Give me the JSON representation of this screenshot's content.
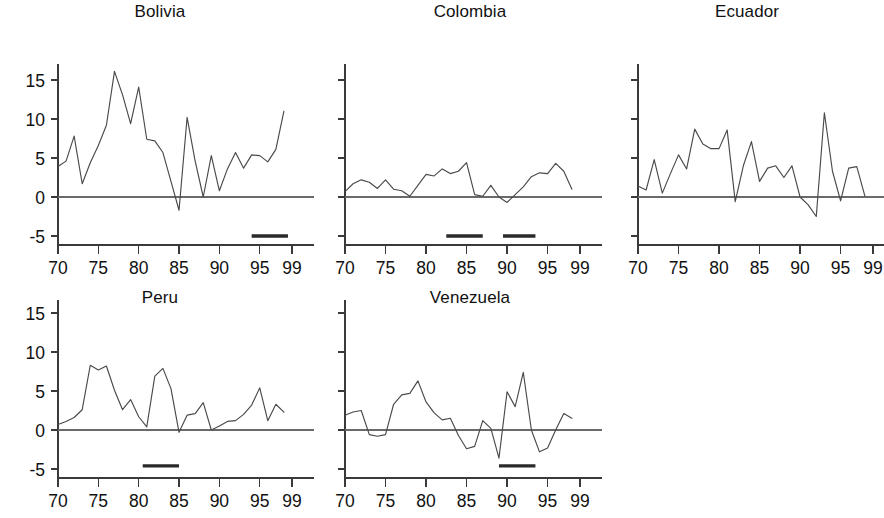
{
  "figure": {
    "background": "#ffffff",
    "line_color": "#4a4a4a",
    "axis_color": "#3a3a3a",
    "zero_line_color": "#6a6a6a",
    "bar_color": "#2a2a2a",
    "layout": "2 rows x 3 columns of small-multiple line panels"
  },
  "chart_data": [
    {
      "type": "line",
      "title": "Bolivia",
      "xlabel": "",
      "ylabel": "",
      "xlim": [
        70,
        99
      ],
      "ylim": [
        -6.5,
        17
      ],
      "yticks": [
        -5,
        0,
        5,
        10,
        15
      ],
      "ytick_labels": [
        "-5",
        "0",
        "5",
        "10",
        "15"
      ],
      "y_axis_labeled": true,
      "xticks": [
        70,
        75,
        80,
        85,
        90,
        95,
        99
      ],
      "xtick_labels": [
        "70",
        "75",
        "80",
        "85",
        "90",
        "95",
        "99"
      ],
      "grid": false,
      "legend": "none",
      "zero_reference_line": 0,
      "x": [
        70,
        71,
        72,
        73,
        74,
        75,
        76,
        77,
        78,
        79,
        80,
        81,
        82,
        83,
        84,
        85,
        86,
        87,
        88,
        89,
        90,
        91,
        92,
        93,
        94,
        95,
        96,
        97,
        98
      ],
      "values": [
        3.9,
        4.6,
        7.8,
        1.7,
        4.4,
        6.6,
        9.2,
        16.1,
        13.1,
        9.4,
        14.1,
        7.4,
        7.2,
        5.7,
        2.0,
        -1.7,
        10.2,
        4.6,
        0.0,
        5.3,
        0.8,
        3.6,
        5.7,
        3.7,
        5.4,
        5.3,
        4.5,
        6.1,
        11.0
      ],
      "annotations": [
        {
          "name": "crisis-bar",
          "label": "banking crisis period",
          "x_start": 94.0,
          "x_end": 98.5,
          "y": -5.0
        }
      ]
    },
    {
      "type": "line",
      "title": "Colombia",
      "xlabel": "",
      "ylabel": "",
      "xlim": [
        70,
        99
      ],
      "ylim": [
        -6.5,
        17
      ],
      "yticks": [
        -5,
        0,
        5,
        10,
        15
      ],
      "ytick_labels": [
        "",
        "",
        "",
        "",
        ""
      ],
      "y_axis_labeled": false,
      "xticks": [
        70,
        75,
        80,
        85,
        90,
        95,
        99
      ],
      "xtick_labels": [
        "70",
        "75",
        "80",
        "85",
        "90",
        "95",
        "99"
      ],
      "grid": false,
      "legend": "none",
      "zero_reference_line": 0,
      "x": [
        70,
        71,
        72,
        73,
        74,
        75,
        76,
        77,
        78,
        79,
        80,
        81,
        82,
        83,
        84,
        85,
        86,
        87,
        88,
        89,
        90,
        91,
        92,
        93,
        94,
        95,
        96,
        97,
        98
      ],
      "values": [
        0.7,
        1.7,
        2.2,
        1.9,
        1.1,
        2.2,
        1.0,
        0.8,
        0.1,
        1.5,
        2.9,
        2.7,
        3.6,
        3.0,
        3.3,
        4.4,
        0.3,
        0.1,
        1.5,
        0.0,
        -0.7,
        0.3,
        1.3,
        2.6,
        3.1,
        3.0,
        4.3,
        3.3,
        1.0
      ],
      "annotations": [
        {
          "name": "crisis-bar",
          "label": "banking crisis period",
          "x_start": 82.5,
          "x_end": 87.0,
          "y": -5.0
        },
        {
          "name": "crisis-bar",
          "label": "banking crisis period",
          "x_start": 89.5,
          "x_end": 93.5,
          "y": -5.0
        }
      ]
    },
    {
      "type": "line",
      "title": "Ecuador",
      "xlabel": "",
      "ylabel": "",
      "xlim": [
        70,
        99
      ],
      "ylim": [
        -6.5,
        17
      ],
      "yticks": [
        -5,
        0,
        5,
        10,
        15
      ],
      "ytick_labels": [
        "",
        "",
        "",
        "",
        ""
      ],
      "y_axis_labeled": false,
      "xticks": [
        70,
        75,
        80,
        85,
        90,
        95,
        99
      ],
      "xtick_labels": [
        "70",
        "75",
        "80",
        "85",
        "90",
        "95",
        "99"
      ],
      "grid": false,
      "legend": "none",
      "zero_reference_line": 0,
      "x": [
        70,
        71,
        72,
        73,
        74,
        75,
        76,
        77,
        78,
        79,
        80,
        81,
        82,
        83,
        84,
        85,
        86,
        87,
        88,
        89,
        90,
        91,
        92,
        93,
        94,
        95,
        96,
        97,
        98
      ],
      "values": [
        1.4,
        0.9,
        4.8,
        0.5,
        3.0,
        5.4,
        3.6,
        8.7,
        6.8,
        6.2,
        6.2,
        8.6,
        -0.6,
        4.0,
        7.1,
        2.0,
        3.7,
        4.0,
        2.5,
        4.0,
        0.0,
        -1.0,
        -2.5,
        10.8,
        3.3,
        -0.5,
        3.7,
        3.9,
        0.1
      ],
      "annotations": []
    },
    {
      "type": "line",
      "title": "Peru",
      "xlabel": "",
      "ylabel": "",
      "xlim": [
        70,
        99
      ],
      "ylim": [
        -6.5,
        17
      ],
      "yticks": [
        -5,
        0,
        5,
        10,
        15
      ],
      "ytick_labels": [
        "-5",
        "0",
        "5",
        "10",
        "15"
      ],
      "y_axis_labeled": true,
      "xticks": [
        70,
        75,
        80,
        85,
        90,
        95,
        99
      ],
      "xtick_labels": [
        "70",
        "75",
        "80",
        "85",
        "90",
        "95",
        "99"
      ],
      "grid": false,
      "legend": "none",
      "zero_reference_line": 0,
      "x": [
        70,
        71,
        72,
        73,
        74,
        75,
        76,
        77,
        78,
        79,
        80,
        81,
        82,
        83,
        84,
        85,
        86,
        87,
        88,
        89,
        90,
        91,
        92,
        93,
        94,
        95,
        96,
        97,
        98
      ],
      "values": [
        0.7,
        1.1,
        1.6,
        2.6,
        8.3,
        7.7,
        8.2,
        5.1,
        2.6,
        3.9,
        1.7,
        0.4,
        6.9,
        7.9,
        5.3,
        -0.3,
        1.9,
        2.1,
        3.5,
        0.0,
        0.5,
        1.1,
        1.2,
        2.0,
        3.2,
        5.4,
        1.2,
        3.3,
        2.3
      ],
      "annotations": [
        {
          "name": "crisis-bar",
          "label": "banking crisis period",
          "x_start": 80.5,
          "x_end": 85.0,
          "y": -4.6
        }
      ]
    },
    {
      "type": "line",
      "title": "Venezuela",
      "xlabel": "",
      "ylabel": "",
      "xlim": [
        70,
        99
      ],
      "ylim": [
        -6.5,
        17
      ],
      "yticks": [
        -5,
        0,
        5,
        10,
        15
      ],
      "ytick_labels": [
        "",
        "",
        "",
        "",
        ""
      ],
      "y_axis_labeled": false,
      "xticks": [
        70,
        75,
        80,
        85,
        90,
        95,
        99
      ],
      "xtick_labels": [
        "70",
        "75",
        "80",
        "85",
        "90",
        "95",
        "99"
      ],
      "grid": false,
      "legend": "none",
      "zero_reference_line": 0,
      "x": [
        70,
        71,
        72,
        73,
        74,
        75,
        76,
        77,
        78,
        79,
        80,
        81,
        82,
        83,
        84,
        85,
        86,
        87,
        88,
        89,
        90,
        91,
        92,
        93,
        94,
        95,
        96,
        97,
        98
      ],
      "values": [
        1.9,
        2.3,
        2.5,
        -0.6,
        -0.8,
        -0.6,
        3.3,
        4.5,
        4.7,
        6.3,
        3.6,
        2.2,
        1.3,
        1.5,
        -0.7,
        -2.4,
        -2.1,
        1.2,
        0.2,
        -3.6,
        4.9,
        3.0,
        7.4,
        0.0,
        -2.8,
        -2.3,
        0.0,
        2.1,
        1.5
      ],
      "annotations": [
        {
          "name": "crisis-bar",
          "label": "banking crisis period",
          "x_start": 89.0,
          "x_end": 93.5,
          "y": -4.6
        }
      ]
    }
  ]
}
